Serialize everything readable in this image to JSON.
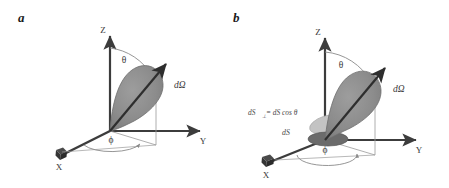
{
  "figure": {
    "background_color": "#ffffff",
    "panels": [
      {
        "id": "a",
        "label": "a",
        "axes": {
          "x": "X",
          "y": "Y",
          "z": "Z"
        },
        "angles": {
          "polar": "θ",
          "azimuth": "ϕ"
        },
        "annotations": {
          "solid_angle": "dΩ"
        }
      },
      {
        "id": "b",
        "label": "b",
        "axes": {
          "x": "X",
          "y": "Y",
          "z": "Z"
        },
        "angles": {
          "polar": "θ",
          "azimuth": "ϕ"
        },
        "annotations": {
          "solid_angle": "dΩ",
          "projected_area_prefix": "dS",
          "projected_area_subscript": "⊥",
          "projected_area_equation": "= dS cos θ",
          "surface_area": "dS"
        }
      }
    ]
  },
  "colors": {
    "axis": "#3c3c3c",
    "cone_fill": "#8e8e8e",
    "cone_stroke": "#6f6f6f",
    "arrow": "#2e2e2e",
    "arc": "#8a8a8a",
    "disk_tilted": "#c3c3c3",
    "disk_flat": "#6b6b6b",
    "text": "#3a3a3a",
    "label": "#1a1a1a"
  }
}
